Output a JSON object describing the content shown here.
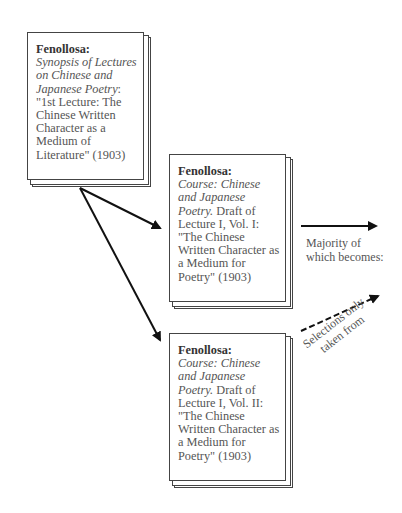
{
  "boxes": [
    {
      "id": "synopsis",
      "title": "Fenollosa:",
      "italic": "Synopsis of Lectures on Chinese and Japanese Poetry",
      "rest": ": \"1st Lecture: The Chinese Written Character as a Medium of Literature\" (1903)"
    },
    {
      "id": "vol1",
      "title": "Fenollosa:",
      "italic": "Course: Chinese and Japanese Poetry.",
      "rest": " Draft of Lecture I, Vol. I: \"The Chinese Written Character as a Medium for Poetry\" (1903)"
    },
    {
      "id": "vol2",
      "title": "Fenollosa:",
      "italic": "Course: Chinese and Japanese Poetry.",
      "rest": " Draft of Lecture I, Vol. II: \"The Chinese Written Character as a Medium for Poetry\" (1903)"
    }
  ],
  "labels": {
    "majority_line1": "Majority of",
    "majority_line2": "which becomes:",
    "selections_line1": "Selections only",
    "selections_line2": "taken from"
  },
  "colors": {
    "line": "#111111",
    "text": "#555555",
    "border": "#444444"
  }
}
